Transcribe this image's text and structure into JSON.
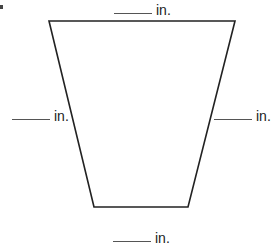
{
  "figure": {
    "type": "trapezoid",
    "stroke_color": "#222222",
    "vertices": {
      "top_left": [
        49,
        21
      ],
      "top_right": [
        235,
        21
      ],
      "bottom_right": [
        188,
        207
      ],
      "bottom_left": [
        94,
        207
      ]
    }
  },
  "labels": {
    "top": {
      "blank": "",
      "unit": "in."
    },
    "left": {
      "blank": "",
      "unit": "in."
    },
    "right": {
      "blank": "",
      "unit": "in."
    },
    "bottom": {
      "blank": "",
      "unit": "in."
    }
  }
}
